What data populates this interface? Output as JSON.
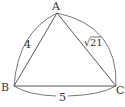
{
  "diagram": {
    "type": "triangle",
    "vertices": [
      {
        "label": "A",
        "x": 57,
        "y": 13
      },
      {
        "label": "B",
        "x": 14,
        "y": 86
      },
      {
        "label": "C",
        "x": 116,
        "y": 86
      }
    ],
    "sides": [
      {
        "from": "A",
        "to": "B",
        "length_label": "4"
      },
      {
        "from": "A",
        "to": "C",
        "length_label": "√21"
      },
      {
        "from": "B",
        "to": "C",
        "length_label": "5"
      }
    ],
    "colors": {
      "stroke": "#444444",
      "text": "#333333",
      "background": "#ffffff"
    }
  },
  "labels": {
    "a": "A",
    "b": "B",
    "c": "C",
    "ab": "4",
    "ac": "21",
    "ac_prefix": "√",
    "bc": "5"
  }
}
